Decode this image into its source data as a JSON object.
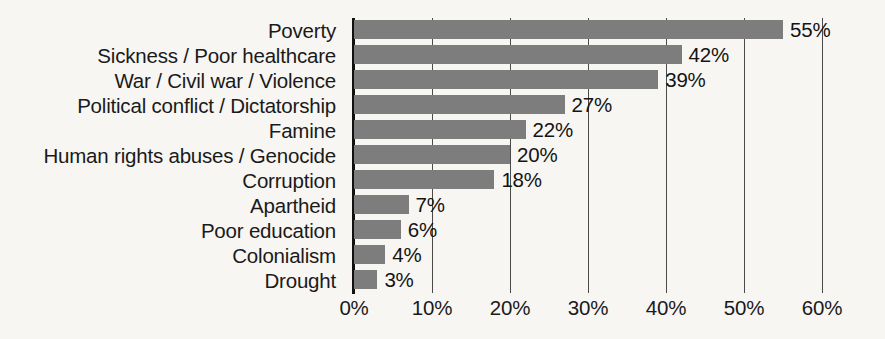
{
  "chart_data": {
    "type": "bar",
    "orientation": "horizontal",
    "title": "",
    "subtitle": "",
    "xlabel": "",
    "ylabel": "",
    "categories": [
      "Poverty",
      "Sickness / Poor healthcare",
      "War / Civil war / Violence",
      "Political conflict / Dictatorship",
      "Famine",
      "Human rights abuses / Genocide",
      "Corruption",
      "Apartheid",
      "Poor education",
      "Colonialism",
      "Drought"
    ],
    "values": [
      55,
      42,
      39,
      27,
      22,
      20,
      18,
      7,
      6,
      4,
      3
    ],
    "value_labels": [
      "55%",
      "42%",
      "39%",
      "27%",
      "22%",
      "20%",
      "18%",
      "7%",
      "6%",
      "4%",
      "3%"
    ],
    "xlim": [
      0,
      60
    ],
    "x_ticks": [
      0,
      10,
      20,
      30,
      40,
      50,
      60
    ],
    "x_tick_labels": [
      "0%",
      "10%",
      "20%",
      "30%",
      "40%",
      "50%",
      "60%"
    ],
    "grid": "vertical",
    "legend": "none",
    "colors": {
      "bar": "#7d7d7d",
      "background": "#f8f6f3",
      "axis": "#111111",
      "gridline": "#4a4a4a",
      "text": "#1a1a1a"
    }
  }
}
